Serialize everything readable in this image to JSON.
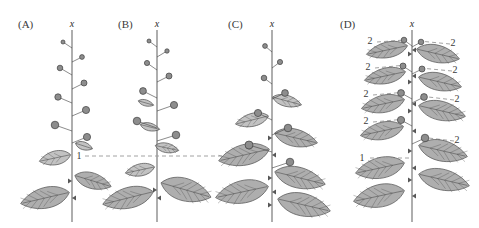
{
  "figure": {
    "background_color": "#ffffff",
    "width": 479,
    "height": 228,
    "stem_color": "#9a9a9a",
    "leaf_fill": "#a8a8a8",
    "leaf_fill_light": "#bdbdbd",
    "leaf_stroke": "#4a4a4a",
    "bud_fill": "#8d8d8d",
    "bud_stroke": "#3f3f3f",
    "dashed_color": "#8a8a8a",
    "text_color": "#3a3a3a"
  },
  "panels": [
    {
      "id": "A",
      "label": "(A)",
      "label_x": 18,
      "label_y": 28,
      "axis_label": "x",
      "axis_label_x": 72,
      "axis_label_y": 27,
      "stem_x": 72,
      "stem_top": 30,
      "stem_bottom": 222,
      "annotations": [
        {
          "text": "1",
          "x": 79,
          "y": 159,
          "dashed_line": {
            "x1": 85,
            "y1": 156,
            "x2": 230,
            "y2": 156
          }
        }
      ],
      "buds": [
        {
          "x": 63,
          "y": 42,
          "r": 2.0,
          "side": "left",
          "stalk_to_x": 72,
          "stalk_to_y": 48
        },
        {
          "x": 82,
          "y": 57,
          "r": 2.4,
          "side": "right",
          "stalk_to_x": 72,
          "stalk_to_y": 62
        },
        {
          "x": 60,
          "y": 68,
          "r": 2.8,
          "side": "left",
          "stalk_to_x": 72,
          "stalk_to_y": 75
        },
        {
          "x": 84,
          "y": 83,
          "r": 3.0,
          "side": "right",
          "stalk_to_x": 72,
          "stalk_to_y": 89
        },
        {
          "x": 58,
          "y": 97,
          "r": 3.2,
          "side": "left",
          "stalk_to_x": 72,
          "stalk_to_y": 103
        },
        {
          "x": 86,
          "y": 110,
          "r": 3.6,
          "side": "right",
          "stalk_to_x": 72,
          "stalk_to_y": 116
        },
        {
          "x": 55,
          "y": 125,
          "r": 3.8,
          "side": "left",
          "stalk_to_x": 72,
          "stalk_to_y": 131
        },
        {
          "x": 87,
          "y": 137,
          "r": 3.6,
          "side": "right",
          "stalk_to_x": 72,
          "stalk_to_y": 143
        }
      ],
      "leaves": [
        {
          "cx": 84,
          "cy": 146,
          "rx": 9,
          "ry": 4.5,
          "angle": 18,
          "side": "right",
          "tone": "light"
        },
        {
          "cx": 55,
          "cy": 158,
          "rx": 16,
          "ry": 8,
          "angle": -12,
          "side": "left",
          "tone": "light"
        },
        {
          "cx": 93,
          "cy": 181,
          "rx": 19,
          "ry": 9,
          "angle": 17,
          "side": "right",
          "tone": "mid"
        },
        {
          "cx": 45,
          "cy": 198,
          "rx": 25,
          "ry": 12,
          "angle": -13,
          "side": "left",
          "tone": "mid"
        }
      ]
    },
    {
      "id": "B",
      "label": "(B)",
      "label_x": 118,
      "label_y": 28,
      "axis_label": "x",
      "axis_label_x": 157,
      "axis_label_y": 27,
      "stem_x": 157,
      "stem_top": 30,
      "stem_bottom": 222,
      "annotations": [],
      "buds": [
        {
          "x": 149,
          "y": 41,
          "r": 2.0,
          "side": "left",
          "stalk_to_x": 157,
          "stalk_to_y": 47
        },
        {
          "x": 167,
          "y": 51,
          "r": 2.2,
          "side": "right",
          "stalk_to_x": 157,
          "stalk_to_y": 57
        },
        {
          "x": 147,
          "y": 63,
          "r": 2.6,
          "side": "left",
          "stalk_to_x": 157,
          "stalk_to_y": 70
        },
        {
          "x": 169,
          "y": 76,
          "r": 3.0,
          "side": "right",
          "stalk_to_x": 157,
          "stalk_to_y": 82
        },
        {
          "x": 143,
          "y": 91,
          "r": 3.4,
          "side": "left",
          "stalk_to_x": 157,
          "stalk_to_y": 98
        },
        {
          "x": 174,
          "y": 105,
          "r": 3.6,
          "side": "right",
          "stalk_to_x": 157,
          "stalk_to_y": 111
        },
        {
          "x": 137,
          "y": 121,
          "r": 3.8,
          "side": "left",
          "stalk_to_x": 157,
          "stalk_to_y": 128
        },
        {
          "x": 176,
          "y": 135,
          "r": 3.8,
          "side": "right",
          "stalk_to_x": 157,
          "stalk_to_y": 141
        }
      ],
      "leaves": [
        {
          "cx": 146,
          "cy": 103,
          "rx": 8,
          "ry": 3.5,
          "angle": 16,
          "side": "right",
          "tone": "light"
        },
        {
          "cx": 150,
          "cy": 127,
          "rx": 10,
          "ry": 4.5,
          "angle": 14,
          "side": "right",
          "tone": "light"
        },
        {
          "cx": 167,
          "cy": 148,
          "rx": 12,
          "ry": 5.5,
          "angle": 12,
          "side": "right",
          "tone": "light"
        },
        {
          "cx": 140,
          "cy": 170,
          "rx": 15,
          "ry": 7,
          "angle": -12,
          "side": "left",
          "tone": "light"
        },
        {
          "cx": 186,
          "cy": 190,
          "rx": 26,
          "ry": 13,
          "angle": 16,
          "side": "right",
          "tone": "mid"
        },
        {
          "cx": 128,
          "cy": 198,
          "rx": 26,
          "ry": 12,
          "angle": -14,
          "side": "left",
          "tone": "mid"
        }
      ]
    },
    {
      "id": "C",
      "label": "(C)",
      "label_x": 228,
      "label_y": 28,
      "axis_label": "x",
      "axis_label_x": 272,
      "axis_label_y": 27,
      "stem_x": 272,
      "stem_top": 30,
      "stem_bottom": 222,
      "annotations": [],
      "buds": [
        {
          "x": 265,
          "y": 46,
          "r": 2.4,
          "side": "left",
          "stalk_to_x": 272,
          "stalk_to_y": 52
        },
        {
          "x": 280,
          "y": 62,
          "r": 2.6,
          "side": "right",
          "stalk_to_x": 272,
          "stalk_to_y": 68
        },
        {
          "x": 264,
          "y": 78,
          "r": 2.8,
          "side": "left",
          "stalk_to_x": 272,
          "stalk_to_y": 84
        },
        {
          "x": 285,
          "y": 93,
          "r": 3.4,
          "side": "right",
          "stalk_to_x": 272,
          "stalk_to_y": 99
        },
        {
          "x": 258,
          "y": 113,
          "r": 3.6,
          "side": "left",
          "stalk_to_x": 272,
          "stalk_to_y": 120
        },
        {
          "x": 288,
          "y": 128,
          "r": 3.8,
          "side": "right",
          "stalk_to_x": 272,
          "stalk_to_y": 135
        },
        {
          "x": 249,
          "y": 145,
          "r": 4.0,
          "side": "left",
          "stalk_to_x": 272,
          "stalk_to_y": 152
        },
        {
          "x": 290,
          "y": 162,
          "r": 3.8,
          "side": "right",
          "stalk_to_x": 272,
          "stalk_to_y": 168
        }
      ],
      "leaves": [
        {
          "cx": 287,
          "cy": 101,
          "rx": 15,
          "ry": 6.5,
          "angle": 15,
          "side": "right",
          "tone": "light"
        },
        {
          "cx": 252,
          "cy": 120,
          "rx": 17,
          "ry": 7.5,
          "angle": -14,
          "side": "left",
          "tone": "light"
        },
        {
          "cx": 296,
          "cy": 138,
          "rx": 22,
          "ry": 10,
          "angle": 13,
          "side": "right",
          "tone": "mid"
        },
        {
          "cx": 244,
          "cy": 155,
          "rx": 26,
          "ry": 12,
          "angle": -13,
          "side": "left",
          "tone": "mid"
        },
        {
          "cx": 300,
          "cy": 178,
          "rx": 26,
          "ry": 12,
          "angle": 14,
          "side": "right",
          "tone": "mid"
        },
        {
          "cx": 242,
          "cy": 192,
          "rx": 27,
          "ry": 13,
          "angle": -12,
          "side": "left",
          "tone": "mid"
        },
        {
          "cx": 304,
          "cy": 205,
          "rx": 27,
          "ry": 13,
          "angle": 13,
          "side": "right",
          "tone": "mid"
        }
      ]
    },
    {
      "id": "D",
      "label": "(D)",
      "label_x": 340,
      "label_y": 28,
      "axis_label": "x",
      "axis_label_x": 412,
      "axis_label_y": 27,
      "stem_x": 412,
      "stem_top": 30,
      "stem_bottom": 222,
      "annotations": [
        {
          "text": "2",
          "x": 370,
          "y": 44,
          "dashed_line": {
            "x1": 377,
            "y1": 42,
            "x2": 405,
            "y2": 40
          }
        },
        {
          "text": "2",
          "x": 453,
          "y": 46,
          "dashed_line": {
            "x1": 450,
            "y1": 44,
            "x2": 419,
            "y2": 41
          }
        },
        {
          "text": "2",
          "x": 368,
          "y": 70,
          "dashed_line": {
            "x1": 375,
            "y1": 68,
            "x2": 406,
            "y2": 65
          }
        },
        {
          "text": "2",
          "x": 455,
          "y": 73,
          "dashed_line": {
            "x1": 452,
            "y1": 71,
            "x2": 420,
            "y2": 68
          }
        },
        {
          "text": "2",
          "x": 366,
          "y": 97,
          "dashed_line": {
            "x1": 373,
            "y1": 95,
            "x2": 406,
            "y2": 92
          }
        },
        {
          "text": "2",
          "x": 457,
          "y": 102,
          "dashed_line": {
            "x1": 454,
            "y1": 100,
            "x2": 420,
            "y2": 96
          }
        },
        {
          "text": "2",
          "x": 366,
          "y": 124,
          "dashed_line": {
            "x1": 373,
            "y1": 122,
            "x2": 406,
            "y2": 119
          }
        },
        {
          "text": "2",
          "x": 457,
          "y": 143,
          "dashed_line": {
            "x1": 454,
            "y1": 141,
            "x2": 420,
            "y2": 137
          }
        },
        {
          "text": "1",
          "x": 362,
          "y": 161,
          "dashed_line": {
            "x1": 370,
            "y1": 158,
            "x2": 412,
            "y2": 158
          }
        }
      ],
      "buds": [
        {
          "x": 404,
          "y": 40,
          "r": 2.8,
          "side": "left",
          "stalk_to_x": 412,
          "stalk_to_y": 46
        },
        {
          "x": 421,
          "y": 42,
          "r": 2.8,
          "side": "right",
          "stalk_to_x": 412,
          "stalk_to_y": 47
        },
        {
          "x": 403,
          "y": 66,
          "r": 3.0,
          "side": "left",
          "stalk_to_x": 412,
          "stalk_to_y": 72
        },
        {
          "x": 422,
          "y": 69,
          "r": 3.0,
          "side": "right",
          "stalk_to_x": 412,
          "stalk_to_y": 74
        },
        {
          "x": 401,
          "y": 93,
          "r": 3.4,
          "side": "left",
          "stalk_to_x": 412,
          "stalk_to_y": 99
        },
        {
          "x": 424,
          "y": 97,
          "r": 3.4,
          "side": "right",
          "stalk_to_x": 412,
          "stalk_to_y": 103
        },
        {
          "x": 401,
          "y": 120,
          "r": 3.6,
          "side": "left",
          "stalk_to_x": 412,
          "stalk_to_y": 126
        },
        {
          "x": 425,
          "y": 138,
          "r": 3.8,
          "side": "right",
          "stalk_to_x": 412,
          "stalk_to_y": 144
        }
      ],
      "leaves": [
        {
          "cx": 387,
          "cy": 50,
          "rx": 21,
          "ry": 9,
          "angle": -12,
          "side": "left",
          "tone": "mid"
        },
        {
          "cx": 438,
          "cy": 54,
          "rx": 22,
          "ry": 10,
          "angle": 13,
          "side": "right",
          "tone": "mid"
        },
        {
          "cx": 385,
          "cy": 76,
          "rx": 21,
          "ry": 9,
          "angle": -12,
          "side": "left",
          "tone": "mid"
        },
        {
          "cx": 440,
          "cy": 82,
          "rx": 22,
          "ry": 10,
          "angle": 13,
          "side": "right",
          "tone": "mid"
        },
        {
          "cx": 383,
          "cy": 104,
          "rx": 22,
          "ry": 10,
          "angle": -12,
          "side": "left",
          "tone": "mid"
        },
        {
          "cx": 442,
          "cy": 111,
          "rx": 24,
          "ry": 11,
          "angle": 13,
          "side": "right",
          "tone": "mid"
        },
        {
          "cx": 382,
          "cy": 131,
          "rx": 22,
          "ry": 10,
          "angle": -12,
          "side": "left",
          "tone": "mid"
        },
        {
          "cx": 443,
          "cy": 151,
          "rx": 25,
          "ry": 12,
          "angle": 13,
          "side": "right",
          "tone": "mid"
        },
        {
          "cx": 380,
          "cy": 168,
          "rx": 25,
          "ry": 12,
          "angle": -12,
          "side": "left",
          "tone": "mid"
        },
        {
          "cx": 444,
          "cy": 180,
          "rx": 26,
          "ry": 12,
          "angle": 13,
          "side": "right",
          "tone": "mid"
        },
        {
          "cx": 379,
          "cy": 196,
          "rx": 26,
          "ry": 13,
          "angle": -12,
          "side": "left",
          "tone": "mid"
        }
      ]
    }
  ]
}
